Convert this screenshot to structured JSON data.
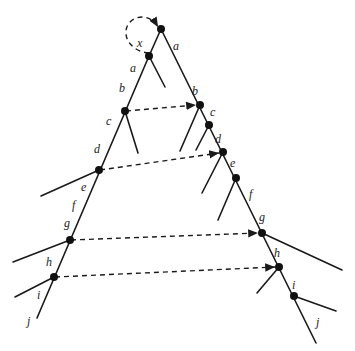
{
  "diagram": {
    "title": "",
    "nodes": [
      {
        "id": "root",
        "x": 161,
        "y": 29
      },
      {
        "id": "x",
        "x": 149,
        "y": 56
      },
      {
        "id": "L_b",
        "x": 125,
        "y": 111
      },
      {
        "id": "L_d",
        "x": 99,
        "y": 170
      },
      {
        "id": "L_g",
        "x": 70,
        "y": 240
      },
      {
        "id": "L_h",
        "x": 54,
        "y": 277
      },
      {
        "id": "R_b",
        "x": 200,
        "y": 105
      },
      {
        "id": "R_c",
        "x": 209,
        "y": 125
      },
      {
        "id": "R_d",
        "x": 223,
        "y": 152
      },
      {
        "id": "R_e",
        "x": 236,
        "y": 178
      },
      {
        "id": "R_g",
        "x": 262,
        "y": 233
      },
      {
        "id": "R_h",
        "x": 279,
        "y": 267
      },
      {
        "id": "R_i",
        "x": 294,
        "y": 296
      }
    ],
    "edges": [
      {
        "x1": 161,
        "y1": 29,
        "x2": 149,
        "y2": 56
      },
      {
        "x1": 149,
        "y1": 56,
        "x2": 37,
        "y2": 318
      },
      {
        "x1": 149,
        "y1": 56,
        "x2": 165,
        "y2": 87
      },
      {
        "x1": 125,
        "y1": 111,
        "x2": 138,
        "y2": 153
      },
      {
        "x1": 99,
        "y1": 170,
        "x2": 41,
        "y2": 196
      },
      {
        "x1": 70,
        "y1": 240,
        "x2": 13,
        "y2": 262
      },
      {
        "x1": 54,
        "y1": 277,
        "x2": 15,
        "y2": 297
      },
      {
        "x1": 161,
        "y1": 29,
        "x2": 316,
        "y2": 343
      },
      {
        "x1": 200,
        "y1": 105,
        "x2": 180,
        "y2": 151
      },
      {
        "x1": 209,
        "y1": 125,
        "x2": 196,
        "y2": 150
      },
      {
        "x1": 223,
        "y1": 152,
        "x2": 202,
        "y2": 193
      },
      {
        "x1": 236,
        "y1": 178,
        "x2": 218,
        "y2": 220
      },
      {
        "x1": 262,
        "y1": 233,
        "x2": 342,
        "y2": 270
      },
      {
        "x1": 279,
        "y1": 267,
        "x2": 257,
        "y2": 293
      },
      {
        "x1": 294,
        "y1": 296,
        "x2": 336,
        "y2": 311
      }
    ],
    "dashed_arrows": [
      {
        "x1": 126,
        "y1": 111,
        "x2": 196,
        "y2": 105
      },
      {
        "x1": 100,
        "y1": 170,
        "x2": 219,
        "y2": 153
      },
      {
        "x1": 71,
        "y1": 240,
        "x2": 258,
        "y2": 233
      },
      {
        "x1": 55,
        "y1": 277,
        "x2": 275,
        "y2": 267
      }
    ],
    "self_loop": {
      "path": "M 149 53 C 135 52, 125 42, 126 31 C 127 17, 148 10, 158 27"
    },
    "labels": [
      {
        "text": "x",
        "x": 137,
        "y": 47
      },
      {
        "text": "a",
        "x": 173,
        "y": 50
      },
      {
        "text": "a",
        "x": 130,
        "y": 72
      },
      {
        "text": "b",
        "x": 119,
        "y": 92
      },
      {
        "text": "c",
        "x": 106,
        "y": 125
      },
      {
        "text": "d",
        "x": 94,
        "y": 153
      },
      {
        "text": "e",
        "x": 81,
        "y": 191
      },
      {
        "text": "f",
        "x": 72,
        "y": 209
      },
      {
        "text": "g",
        "x": 64,
        "y": 227
      },
      {
        "text": "h",
        "x": 46,
        "y": 266
      },
      {
        "text": "i",
        "x": 37,
        "y": 299
      },
      {
        "text": "j",
        "x": 27,
        "y": 325
      },
      {
        "text": "b",
        "x": 192,
        "y": 95
      },
      {
        "text": "c",
        "x": 210,
        "y": 116
      },
      {
        "text": "d",
        "x": 215,
        "y": 143
      },
      {
        "text": "e",
        "x": 230,
        "y": 167
      },
      {
        "text": "f",
        "x": 249,
        "y": 198
      },
      {
        "text": "g",
        "x": 259,
        "y": 221
      },
      {
        "text": "h",
        "x": 274,
        "y": 257
      },
      {
        "text": "i",
        "x": 292,
        "y": 289
      },
      {
        "text": "j",
        "x": 316,
        "y": 326
      }
    ]
  }
}
